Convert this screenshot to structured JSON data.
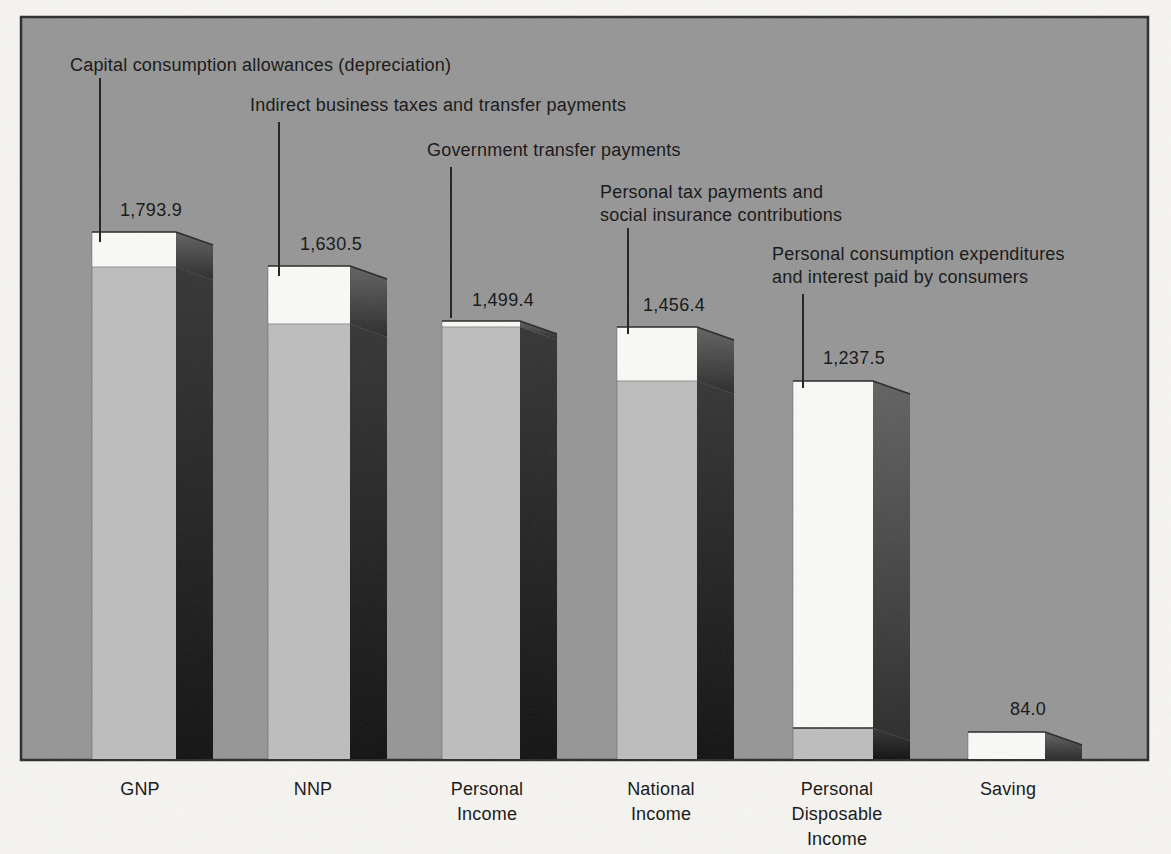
{
  "chart_data": {
    "type": "bar",
    "style": "3d-block-bars, scanned textbook figure, no axes or gridlines",
    "categories": [
      "GNP",
      "NNP",
      "Personal Income",
      "National Income",
      "Personal Disposable Income",
      "Saving"
    ],
    "values": [
      1793.9,
      1630.5,
      1499.4,
      1456.4,
      1237.5,
      84.0
    ],
    "value_labels": [
      "1,793.9",
      "1,630.5",
      "1,499.4",
      "1,456.4",
      "1,237.5",
      "84.0"
    ],
    "category_display_lines": [
      [
        "GNP"
      ],
      [
        "NNP"
      ],
      [
        "Personal",
        "Income"
      ],
      [
        "National",
        "Income"
      ],
      [
        "Personal",
        "Disposable",
        "Income"
      ],
      [
        "Saving"
      ]
    ],
    "bars": [
      {
        "category": "GNP",
        "value": 1793.9,
        "value_label": "1,793.9",
        "white_segment_meaning": "Capital consumption allowances (depreciation)"
      },
      {
        "category": "NNP",
        "value": 1630.5,
        "value_label": "1,630.5",
        "white_segment_meaning": "Indirect business taxes and transfer payments"
      },
      {
        "category": "Personal Income",
        "value": 1499.4,
        "value_label": "1,499.4",
        "white_segment_meaning": "Government transfer payments"
      },
      {
        "category": "National Income",
        "value": 1456.4,
        "value_label": "1,456.4",
        "white_segment_meaning": "Personal tax payments and social insurance contributions"
      },
      {
        "category": "Personal Disposable Income",
        "value": 1237.5,
        "value_label": "1,237.5",
        "white_segment_meaning": "Personal consumption expenditures and interest paid by consumers"
      },
      {
        "category": "Saving",
        "value": 84.0,
        "value_label": "84.0",
        "white_segment_meaning": null
      }
    ],
    "annotations": [
      {
        "lines": [
          "Capital consumption allowances (depreciation)"
        ],
        "target": "GNP"
      },
      {
        "lines": [
          "Indirect business taxes and transfer payments"
        ],
        "target": "NNP"
      },
      {
        "lines": [
          "Government transfer payments"
        ],
        "target": "Personal Income"
      },
      {
        "lines": [
          "Personal tax payments and",
          "social insurance contributions"
        ],
        "target": "National Income"
      },
      {
        "lines": [
          "Personal consumption expenditures",
          "and interest paid by consumers"
        ],
        "target": "Personal Disposable Income"
      }
    ],
    "legend": "none",
    "grid": false
  },
  "colors": {
    "page_bg": "#f6f5f1",
    "panel_bg": "#959595",
    "panel_border": "#2b2b2b",
    "bar_white": "#fafaf7",
    "bar_gray": "#bdbdbd",
    "side_white_top": "#616161",
    "side_white_bottom": "#2a2a2a",
    "side_gray_top": "#343434",
    "side_gray_bottom": "#101010",
    "leader_line": "#1f1f1f",
    "edge_line": "#262626",
    "boundary_line": "#8e8e8e",
    "text": "#1b1b1b"
  },
  "layout": {
    "canvas": {
      "w": 1171,
      "h": 854
    },
    "panel": {
      "x": 21,
      "y": 17,
      "w": 1127,
      "h": 743
    },
    "bar_bottom": 759,
    "depth": {
      "dx": 37,
      "dy": 13
    },
    "bars": [
      {
        "id": "gnp",
        "x": 92,
        "w": 84,
        "segments": [
          {
            "tone": "white",
            "y0": 232,
            "y1": 267
          },
          {
            "tone": "gray",
            "y0": 267,
            "y1": 759
          }
        ]
      },
      {
        "id": "nnp",
        "x": 268,
        "w": 82,
        "segments": [
          {
            "tone": "white",
            "y0": 266,
            "y1": 324
          },
          {
            "tone": "gray",
            "y0": 324,
            "y1": 759
          }
        ]
      },
      {
        "id": "personal-income",
        "x": 442,
        "w": 78,
        "segments": [
          {
            "tone": "white",
            "y0": 321,
            "y1": 327
          },
          {
            "tone": "gray",
            "y0": 327,
            "y1": 759
          }
        ]
      },
      {
        "id": "national-income",
        "x": 617,
        "w": 80,
        "segments": [
          {
            "tone": "white",
            "y0": 327,
            "y1": 381
          },
          {
            "tone": "gray",
            "y0": 381,
            "y1": 759
          }
        ]
      },
      {
        "id": "personal-disposable-income",
        "x": 793,
        "w": 80,
        "boundary_dark": true,
        "segments": [
          {
            "tone": "white",
            "y0": 381,
            "y1": 728
          },
          {
            "tone": "gray",
            "y0": 728,
            "y1": 759
          }
        ]
      },
      {
        "id": "saving",
        "x": 968,
        "w": 77,
        "segments": [
          {
            "tone": "white",
            "y0": 732,
            "y1": 759
          }
        ]
      }
    ],
    "leader_lines": [
      {
        "x": 100,
        "y1": 78,
        "y2": 242
      },
      {
        "x": 279,
        "y1": 122,
        "y2": 276
      },
      {
        "x": 451,
        "y1": 167,
        "y2": 318
      },
      {
        "x": 628,
        "y1": 228,
        "y2": 334
      },
      {
        "x": 803,
        "y1": 294,
        "y2": 388
      }
    ],
    "annotation_pos": [
      {
        "x": 70,
        "y": 54
      },
      {
        "x": 250,
        "y": 94
      },
      {
        "x": 427,
        "y": 139
      },
      {
        "x": 600,
        "y": 181
      },
      {
        "x": 772,
        "y": 243
      }
    ],
    "value_pos": [
      {
        "cx": 151,
        "y": 200
      },
      {
        "cx": 331,
        "y": 234
      },
      {
        "cx": 503,
        "y": 290
      },
      {
        "cx": 674,
        "y": 295
      },
      {
        "cx": 854,
        "y": 348
      },
      {
        "cx": 1028,
        "y": 699
      }
    ],
    "category_pos": [
      {
        "cx": 140,
        "y": 777
      },
      {
        "cx": 313,
        "y": 777
      },
      {
        "cx": 487,
        "y": 777
      },
      {
        "cx": 661,
        "y": 777
      },
      {
        "cx": 837,
        "y": 777
      },
      {
        "cx": 1008,
        "y": 777
      }
    ]
  }
}
